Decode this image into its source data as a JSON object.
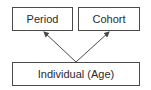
{
  "diagram": {
    "nodes": [
      {
        "id": "period",
        "label": "Period"
      },
      {
        "id": "cohort",
        "label": "Cohort"
      },
      {
        "id": "individual",
        "label": "Individual (Age)"
      }
    ],
    "edges": [
      {
        "from": "individual",
        "to": "period"
      },
      {
        "from": "individual",
        "to": "cohort"
      }
    ],
    "colors": {
      "stroke": "#4a4a4a",
      "text": "#2a2a2a",
      "background": "#ffffff"
    }
  }
}
